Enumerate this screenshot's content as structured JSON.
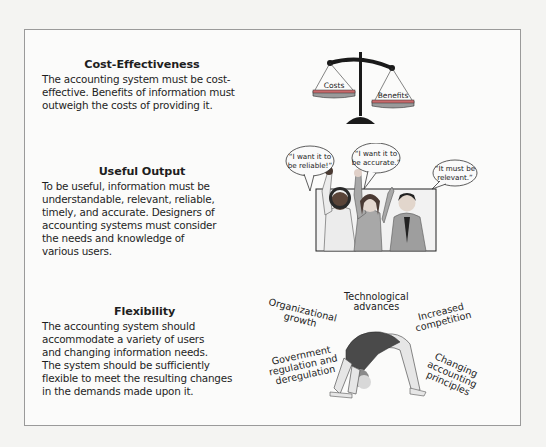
{
  "sections": [
    {
      "title": "Cost-Effectiveness",
      "lines": [
        "The accounting system must be cost-",
        "effective. Benefits of information must",
        "outweigh the costs of providing it."
      ],
      "illustration": {
        "type": "balance-scale",
        "left_pan_label": "Costs",
        "right_pan_label": "Benefits"
      }
    },
    {
      "title": "Useful Output",
      "lines": [
        "To be useful, information must be",
        "understandable, relevant, reliable,",
        "timely, and accurate. Designers of",
        "accounting systems must consider",
        "the needs and knowledge of",
        "various users."
      ],
      "illustration": {
        "type": "users-with-speech-bubbles",
        "bubbles": [
          {
            "line1": "“I want it to",
            "line2": "be reliable!”"
          },
          {
            "line1": "“I want it to",
            "line2": "be accurate.”"
          },
          {
            "line1": "“It must be",
            "line2": "relevant.”"
          }
        ]
      }
    },
    {
      "title": "Flexibility",
      "lines": [
        "The accounting system should",
        "accommodate a variety of users",
        "and changing information needs.",
        "The system should be sufficiently",
        "flexible to meet the resulting changes",
        "in the demands made upon it."
      ],
      "illustration": {
        "type": "gymnast-backbend",
        "labels": {
          "organizational": [
            "Organizational",
            "growth"
          ],
          "technological": [
            "Technological",
            "advances"
          ],
          "competition": [
            "Increased",
            "competition"
          ],
          "government": [
            "Government",
            "regulation and",
            "deregulation"
          ],
          "accounting": [
            "Changing",
            "accounting",
            "principles"
          ]
        }
      }
    }
  ],
  "colors": {
    "frame_border": "#9a9a9a",
    "pan_fill": "#c9696b",
    "pan_rim": "#9a9a9a",
    "scale_dark": "#1a1a1a",
    "leotard": "#4a4a4a",
    "skin": "#e6e6e6"
  }
}
